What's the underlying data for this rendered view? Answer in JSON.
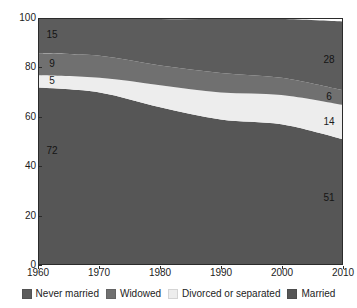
{
  "chart_data": {
    "type": "area",
    "stacked": true,
    "title": "",
    "subtitle": "",
    "xlabel": "",
    "ylabel": "",
    "x": [
      1960,
      1970,
      1980,
      1990,
      2000,
      2010
    ],
    "xlim": [
      1960,
      2010
    ],
    "ylim": [
      0,
      100
    ],
    "grid": false,
    "legend_position": "bottom",
    "x_tick_labels": [
      "1960",
      "1970",
      "1980",
      "1990",
      "2000",
      "2010"
    ],
    "y_tick_labels": [
      "0",
      "20",
      "40",
      "60",
      "80",
      "100"
    ],
    "y_ticks": [
      0,
      20,
      40,
      60,
      80,
      100
    ],
    "series": [
      {
        "name": "Married",
        "color": "#565656",
        "values": [
          72,
          70,
          64,
          59,
          57,
          51
        ],
        "stack_order": 1
      },
      {
        "name": "Divorced or separated",
        "color": "#ededed",
        "values": [
          5,
          6,
          9,
          11,
          12,
          14
        ],
        "stack_order": 2
      },
      {
        "name": "Widowed",
        "color": "#707070",
        "values": [
          9,
          9,
          8,
          8,
          7,
          6
        ],
        "stack_order": 3
      },
      {
        "name": "Never married",
        "color": "#5c5c5c",
        "values": [
          15,
          16,
          19,
          22,
          24,
          28
        ],
        "stack_order": 4
      }
    ],
    "annotations": {
      "left": [
        {
          "text": "15",
          "series": "Never married",
          "year": 1960,
          "value": 15
        },
        {
          "text": "9",
          "series": "Widowed",
          "year": 1960,
          "value": 9
        },
        {
          "text": "5",
          "series": "Divorced or separated",
          "year": 1960,
          "value": 5
        },
        {
          "text": "72",
          "series": "Married",
          "year": 1960,
          "value": 72
        }
      ],
      "right": [
        {
          "text": "28",
          "series": "Never married",
          "year": 2010,
          "value": 28
        },
        {
          "text": "6",
          "series": "Widowed",
          "year": 2010,
          "value": 6
        },
        {
          "text": "14",
          "series": "Divorced or separated",
          "year": 2010,
          "value": 14
        },
        {
          "text": "51",
          "series": "Married",
          "year": 2010,
          "value": 51
        }
      ]
    }
  },
  "legend": {
    "items": [
      {
        "label": "Never married",
        "color": "#5c5c5c"
      },
      {
        "label": "Widowed",
        "color": "#707070"
      },
      {
        "label": "Divorced or separated",
        "color": "#ededed"
      },
      {
        "label": "Married",
        "color": "#565656"
      }
    ]
  },
  "axis": {
    "frame_color": "#2b2b2b"
  }
}
